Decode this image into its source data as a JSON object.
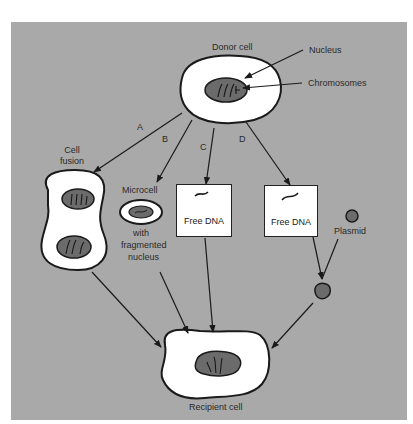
{
  "diagram": {
    "colors": {
      "background": "#a9a9a9",
      "cell_fill": "#ffffff",
      "nucleus_fill": "#6b6b6b",
      "outline": "#1a1a1a"
    },
    "donor": {
      "label": "Donor cell",
      "nucleus_label": "Nucleus",
      "chromosomes_label": "Chromosomes"
    },
    "pathways": [
      {
        "id": "A",
        "letter": "A",
        "label": "Cell fusion"
      },
      {
        "id": "B",
        "letter": "B",
        "label": "Microcell",
        "sublabel_lines": [
          "with",
          "fragmented",
          "nucleus"
        ]
      },
      {
        "id": "C",
        "letter": "C",
        "box_label": "Free DNA"
      },
      {
        "id": "D",
        "letter": "D",
        "box_label": "Free DNA",
        "extra_label": "Plasmid"
      }
    ],
    "recipient": {
      "label": "Recipient cell"
    }
  }
}
